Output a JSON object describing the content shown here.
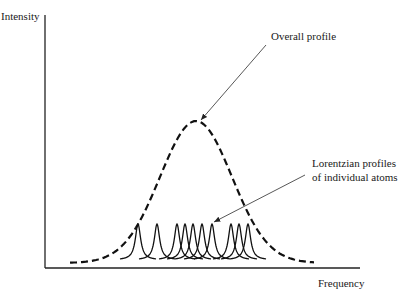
{
  "labels": {
    "y_axis": "Intensity",
    "x_axis": "Frequency",
    "overall": "Overall profile",
    "lorentz_line1": "Lorentzian profiles",
    "lorentz_line2": "of individual atoms"
  },
  "chart_data": {
    "type": "line",
    "title": "",
    "xlabel": "Frequency",
    "ylabel": "Intensity",
    "grid": false,
    "annotations": [
      {
        "text": "Overall profile",
        "points_to": "peak of dashed Gaussian envelope"
      },
      {
        "text": "Lorentzian profiles of individual atoms",
        "points_to": "one of the narrow solid peaks"
      }
    ],
    "series": [
      {
        "name": "Overall profile",
        "style": "dashed",
        "shape": "gaussian",
        "center_px": 196,
        "peak_y_px": 121,
        "baseline_y_px": 263,
        "x_range_px": [
          70,
          315
        ]
      },
      {
        "name": "Lorentzian profiles of individual atoms",
        "style": "solid",
        "shape": "lorentzian",
        "count": 10,
        "centers_px": [
          138,
          157,
          177,
          185,
          193,
          202,
          212,
          231,
          239,
          248
        ],
        "peak_y_px": 224,
        "baseline_y_px": 260
      }
    ]
  }
}
